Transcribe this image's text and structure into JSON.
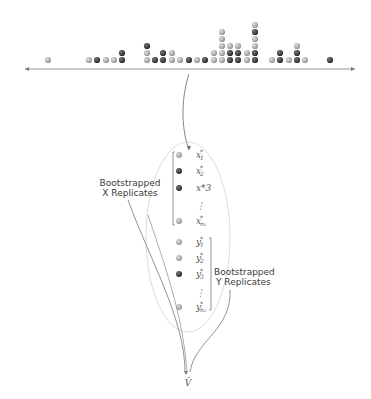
{
  "diagram": {
    "dotplot": {
      "columns": [
        {
          "dots": [
            "light"
          ]
        },
        {
          "dots": [
            "light"
          ]
        },
        {
          "dots": [
            "dark"
          ]
        },
        {
          "dots": [
            "light"
          ]
        },
        {
          "dots": [
            "light"
          ]
        },
        {
          "dots": [
            "dark",
            "dark"
          ]
        },
        {
          "dots": [
            "light",
            "light",
            "dark"
          ]
        },
        {
          "dots": [
            "dark"
          ]
        },
        {
          "dots": [
            "dark",
            "dark"
          ]
        },
        {
          "dots": [
            "light",
            "light"
          ]
        },
        {
          "dots": [
            "light"
          ]
        },
        {
          "dots": [
            "dark"
          ]
        },
        {
          "dots": [
            "light"
          ]
        },
        {
          "dots": [
            "dark"
          ]
        },
        {
          "dots": [
            "light",
            "light"
          ]
        },
        {
          "dots": [
            "light",
            "light",
            "light",
            "light",
            "light"
          ]
        },
        {
          "dots": [
            "dark",
            "dark",
            "light"
          ]
        },
        {
          "dots": [
            "dark",
            "dark",
            "light"
          ]
        },
        {
          "dots": [
            "light",
            "light"
          ]
        },
        {
          "dots": [
            "dark",
            "dark",
            "light",
            "light",
            "dark",
            "light"
          ]
        },
        {
          "dots": [
            "light"
          ]
        },
        {
          "dots": [
            "dark",
            "dark"
          ]
        },
        {
          "dots": [
            "light"
          ]
        },
        {
          "dots": [
            "dark",
            "dark",
            "light"
          ]
        },
        {
          "dots": [
            "light"
          ]
        },
        {
          "dots": [
            "dark"
          ]
        }
      ]
    },
    "x_replicates": [
      {
        "var": "x",
        "sub": "1",
        "star": "*",
        "shade": "light"
      },
      {
        "var": "x",
        "sub": "2",
        "star": "*",
        "shade": "dark"
      },
      {
        "var": "x",
        "sub": "3",
        "star": "*",
        "shade": "dark",
        "alt_text": "x*3"
      },
      {
        "var": "⋮",
        "sub": "",
        "star": "",
        "shade": "none"
      },
      {
        "var": "x",
        "sub": "n₁",
        "star": "*",
        "shade": "light"
      }
    ],
    "y_replicates": [
      {
        "var": "y",
        "sub": "1",
        "star": "*",
        "shade": "light"
      },
      {
        "var": "y",
        "sub": "2",
        "star": "*",
        "shade": "light"
      },
      {
        "var": "y",
        "sub": "3",
        "star": "*",
        "shade": "dark"
      },
      {
        "var": "⋮",
        "sub": "",
        "star": "",
        "shade": "none"
      },
      {
        "var": "y",
        "sub": "n₂",
        "star": "*",
        "shade": "light"
      }
    ],
    "labels": {
      "x_group_line1": "Bootstrapped",
      "x_group_line2": "X Replicates",
      "y_group_line1": "Bootstrapped",
      "y_group_line2": "Y Replicates",
      "output": "V̂"
    },
    "colors": {
      "dark_dot": "#3c3c3c",
      "light_dot": "#a8a8a8",
      "line": "#777777",
      "ellipse": "#d6d6d6"
    }
  }
}
